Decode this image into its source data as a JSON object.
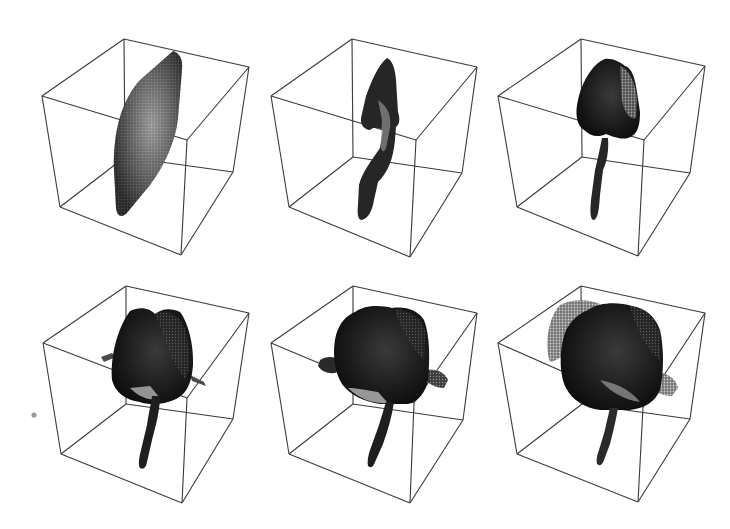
{
  "figure": {
    "layout": {
      "rows": 2,
      "cols": 3
    },
    "colors": {
      "background": "#ffffff",
      "cube_edge": "#3a3a3a",
      "voxel_dark": "#1c1c1c",
      "voxel_mid": "#555555",
      "voxel_light": "#b5b5b5"
    },
    "panels": [
      {
        "id": 1,
        "stage": "flat sheet",
        "cube": {
          "TB": [
            124,
            39
          ],
          "TR": [
            249,
            67
          ],
          "TL": [
            42,
            96
          ],
          "TF": [
            187,
            140
          ],
          "BB": [
            125,
            157
          ],
          "BR": [
            233,
            172
          ],
          "BL": [
            60,
            207
          ],
          "BF": [
            181,
            255
          ]
        }
      },
      {
        "id": 2,
        "stage": "thin curved stalk",
        "cube": {
          "TB": [
            352,
            39
          ],
          "TR": [
            477,
            67
          ],
          "TL": [
            271,
            96
          ],
          "TF": [
            416,
            140
          ],
          "BB": [
            353,
            157
          ],
          "BR": [
            462,
            173
          ],
          "BL": [
            289,
            207
          ],
          "BF": [
            410,
            257
          ]
        }
      },
      {
        "id": 3,
        "stage": "stalk with small bud",
        "cube": {
          "TB": [
            581,
            39
          ],
          "TR": [
            705,
            66
          ],
          "TL": [
            498,
            96
          ],
          "TF": [
            644,
            140
          ],
          "BB": [
            582,
            157
          ],
          "BR": [
            690,
            173
          ],
          "BL": [
            517,
            207
          ],
          "BF": [
            638,
            256
          ]
        }
      },
      {
        "id": 4,
        "stage": "stalk with bud and side leaves",
        "cube": {
          "TB": [
            126,
            286
          ],
          "TR": [
            249,
            313
          ],
          "TL": [
            43,
            343
          ],
          "TF": [
            187,
            398
          ],
          "BB": [
            126,
            404
          ],
          "BR": [
            233,
            419
          ],
          "BL": [
            61,
            454
          ],
          "BF": [
            182,
            503
          ]
        }
      },
      {
        "id": 5,
        "stage": "enlarged bud with wings",
        "cube": {
          "TB": [
            353,
            286
          ],
          "TR": [
            477,
            313
          ],
          "TL": [
            271,
            343
          ],
          "TF": [
            414,
            403
          ],
          "BB": [
            353,
            404
          ],
          "BR": [
            463,
            420
          ],
          "BL": [
            289,
            454
          ],
          "BF": [
            410,
            503
          ]
        }
      },
      {
        "id": 6,
        "stage": "full rounded bud",
        "cube": {
          "TB": [
            581,
            286
          ],
          "TR": [
            705,
            313
          ],
          "TL": [
            498,
            343
          ],
          "TF": [
            643,
            407
          ],
          "BB": [
            582,
            404
          ],
          "BR": [
            690,
            419
          ],
          "BL": [
            517,
            454
          ],
          "BF": [
            638,
            502
          ]
        }
      }
    ],
    "stray_mark": {
      "x": 34,
      "y": 415
    }
  }
}
